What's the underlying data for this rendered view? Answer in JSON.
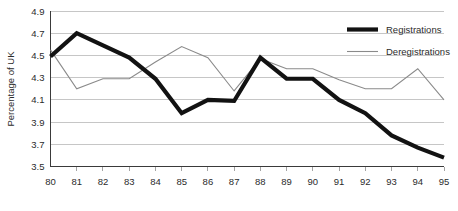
{
  "chart_data": {
    "type": "line",
    "title": "",
    "subtitle": "",
    "xlabel": "",
    "ylabel": "Percentage of UK",
    "x": [
      "80",
      "81",
      "82",
      "83",
      "84",
      "85",
      "86",
      "87",
      "88",
      "89",
      "90",
      "91",
      "92",
      "93",
      "94",
      "95"
    ],
    "categories": [
      "80",
      "81",
      "82",
      "83",
      "84",
      "85",
      "86",
      "87",
      "88",
      "89",
      "90",
      "91",
      "92",
      "93",
      "94",
      "95"
    ],
    "xlim": [
      0,
      15
    ],
    "ylim": [
      3.5,
      4.9
    ],
    "yticks": [
      "4.9",
      "4.7",
      "4.5",
      "4.3",
      "4.1",
      "3.9",
      "3.7",
      "3.5"
    ],
    "ytick_values": [
      4.9,
      4.7,
      4.5,
      4.3,
      4.1,
      3.9,
      3.7,
      3.5
    ],
    "grid": true,
    "grid_axis": "y",
    "legend_position": "top-right",
    "series": [
      {
        "name": "Registrations",
        "style": "thick-black",
        "color": "#121212",
        "values": [
          4.49,
          4.7,
          4.59,
          4.48,
          4.29,
          3.98,
          4.1,
          4.09,
          4.48,
          4.29,
          4.29,
          4.1,
          3.98,
          3.78,
          3.67,
          3.58
        ]
      },
      {
        "name": "Deregistrations",
        "style": "thin-gray",
        "color": "#8a8a8a",
        "values": [
          4.55,
          4.2,
          4.29,
          4.29,
          4.44,
          4.58,
          4.48,
          4.18,
          4.47,
          4.38,
          4.38,
          4.28,
          4.2,
          4.2,
          4.38,
          4.1
        ]
      }
    ]
  },
  "legend": {
    "items": [
      {
        "label": "Registrations"
      },
      {
        "label": "Deregistrations"
      }
    ]
  },
  "axes": {
    "y_title": "Percentage of UK"
  },
  "colors": {
    "background": "#ffffff",
    "gridline": "#b8b8b8",
    "axis": "#3a3a3a",
    "registrations": "#121212",
    "deregistrations": "#8a8a8a",
    "text": "#2b2b2b"
  }
}
